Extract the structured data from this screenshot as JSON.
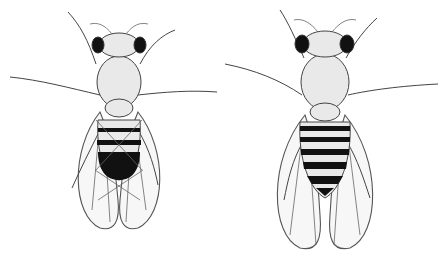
{
  "figure": {
    "flies": [
      {
        "position": "left",
        "description": "male fruit fly with dark rounded abdomen tip"
      },
      {
        "position": "right",
        "description": "female fruit fly with striped pointed abdomen"
      }
    ],
    "colors": {
      "background": "#ffffff",
      "ink": "#222222",
      "wing_fill": "#f7f7f7"
    }
  }
}
